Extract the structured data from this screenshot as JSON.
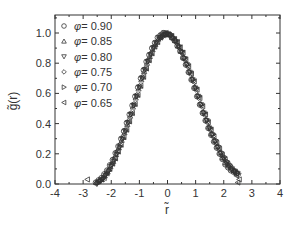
{
  "chart_data": {
    "type": "scatter",
    "title": "",
    "xlabel": "r̃",
    "ylabel": "g̃(r)",
    "xlim": [
      -4,
      4
    ],
    "ylim": [
      0,
      1.12
    ],
    "xticks": [
      -4,
      -3,
      -2,
      -1,
      0,
      1,
      2,
      3,
      4
    ],
    "yticks": [
      0.0,
      0.2,
      0.4,
      0.6,
      0.8,
      1.0
    ],
    "xtick_labels": [
      "-4",
      "-3",
      "-2",
      "-1",
      "0",
      "1",
      "2",
      "3",
      "4"
    ],
    "ytick_labels": [
      "0.0",
      "0.2",
      "0.4",
      "0.6",
      "0.8",
      "1.0"
    ],
    "grid": false,
    "legend_position": "upper-left",
    "x": [
      -2.5,
      -2.3,
      -2.1,
      -1.9,
      -1.7,
      -1.5,
      -1.3,
      -1.1,
      -0.9,
      -0.7,
      -0.5,
      -0.3,
      -0.1,
      0.1,
      0.3,
      0.5,
      0.7,
      0.9,
      1.1,
      1.3,
      1.5,
      1.7,
      1.9,
      2.1,
      2.3,
      2.5
    ],
    "series": [
      {
        "name": "φ = 0.90",
        "marker": "circle",
        "values": [
          0.01,
          0.04,
          0.09,
          0.16,
          0.25,
          0.35,
          0.46,
          0.58,
          0.7,
          0.81,
          0.9,
          0.97,
          1.0,
          0.99,
          0.95,
          0.88,
          0.79,
          0.69,
          0.58,
          0.47,
          0.37,
          0.28,
          0.2,
          0.13,
          0.09,
          0.07
        ]
      },
      {
        "name": "φ = 0.85",
        "marker": "triangle-up",
        "values": [
          0.01,
          0.03,
          0.08,
          0.15,
          0.24,
          0.34,
          0.45,
          0.57,
          0.69,
          0.8,
          0.89,
          0.96,
          0.99,
          0.99,
          0.95,
          0.88,
          0.8,
          0.7,
          0.59,
          0.48,
          0.38,
          0.29,
          0.21,
          0.14,
          0.1,
          0.08
        ]
      },
      {
        "name": "φ = 0.80",
        "marker": "triangle-down",
        "values": [
          0.0,
          0.03,
          0.08,
          0.15,
          0.24,
          0.35,
          0.46,
          0.58,
          0.7,
          0.81,
          0.9,
          0.97,
          1.0,
          0.98,
          0.94,
          0.87,
          0.79,
          0.69,
          0.58,
          0.47,
          0.37,
          0.28,
          0.2,
          0.14,
          0.1,
          0.07
        ]
      },
      {
        "name": "φ = 0.75",
        "marker": "diamond",
        "values": [
          0.01,
          0.04,
          0.09,
          0.17,
          0.26,
          0.36,
          0.47,
          0.59,
          0.71,
          0.82,
          0.91,
          0.97,
          1.0,
          0.99,
          0.94,
          0.87,
          0.78,
          0.68,
          0.57,
          0.46,
          0.36,
          0.27,
          0.19,
          0.13,
          0.09,
          0.06
        ]
      },
      {
        "name": "φ = 0.70",
        "marker": "triangle-right",
        "values": [
          0.01,
          0.04,
          0.09,
          0.16,
          0.25,
          0.35,
          0.46,
          0.58,
          0.7,
          0.81,
          0.9,
          0.96,
          0.99,
          0.99,
          0.95,
          0.88,
          0.79,
          0.69,
          0.58,
          0.47,
          0.37,
          0.29,
          0.21,
          0.15,
          0.1,
          0.07
        ]
      },
      {
        "name": "φ = 0.65",
        "marker": "triangle-left",
        "values": [
          0.02,
          0.04,
          0.1,
          0.17,
          0.26,
          0.36,
          0.47,
          0.59,
          0.71,
          0.82,
          0.91,
          0.97,
          1.0,
          0.98,
          0.94,
          0.87,
          0.78,
          0.68,
          0.57,
          0.46,
          0.36,
          0.27,
          0.19,
          0.13,
          0.08,
          0.03
        ]
      }
    ],
    "extra_points": [
      {
        "series": "φ = 0.65",
        "x": -2.85,
        "y": 0.03
      },
      {
        "series": "φ = 0.65",
        "x": 2.5,
        "y": 0.01
      }
    ]
  },
  "colors": {
    "axis": "#333333",
    "marker_stroke": "#333333",
    "background": "#ffffff"
  }
}
